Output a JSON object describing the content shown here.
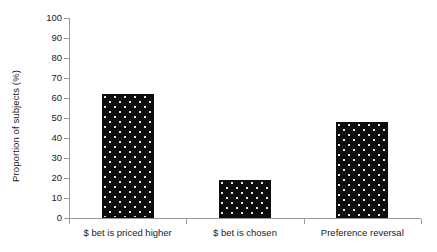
{
  "chart_data": {
    "type": "bar",
    "title": "",
    "subtitle": "",
    "xlabel": "",
    "ylabel": "Proportion of subjects (%)",
    "categories": [
      "$ bet is priced higher",
      "$ bet is chosen",
      "Preference reversal"
    ],
    "values": [
      62,
      19,
      48
    ],
    "series": [
      {
        "name": "Proportion of subjects",
        "values": [
          62,
          19,
          48
        ]
      }
    ],
    "ylim": [
      0,
      100
    ],
    "ytick_labels": [
      "0",
      "10",
      "20",
      "30",
      "40",
      "50",
      "60",
      "70",
      "80",
      "90",
      "100"
    ],
    "ytick_values": [
      0,
      10,
      20,
      30,
      40,
      50,
      60,
      70,
      80,
      90,
      100
    ],
    "grid": false,
    "legend": false,
    "legend_position": "none",
    "bar_fill_color": "#0d0d0d",
    "bar_pattern": "dotted",
    "axis_color": "#9a9a9a",
    "text_color": "#1a1a1a",
    "background_color": "#ffffff"
  }
}
